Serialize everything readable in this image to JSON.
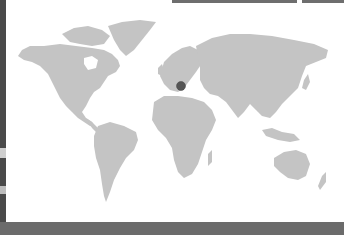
{
  "map": {
    "type": "world-choropleth",
    "land_color": "#c4c4c4",
    "ocean_color": "#ffffff",
    "marker": {
      "label": "",
      "color": "#555555",
      "x": 181,
      "y": 86,
      "region": "Central Europe"
    }
  },
  "top_bars": [
    {
      "x": 172,
      "width": 125,
      "color": "#6e6e6e"
    },
    {
      "x": 302,
      "width": 42,
      "color": "#6e6e6e"
    }
  ],
  "bottom_strip": {
    "color": "#6b6b6b"
  },
  "left_strip": {
    "color": "#4a4a4a"
  }
}
